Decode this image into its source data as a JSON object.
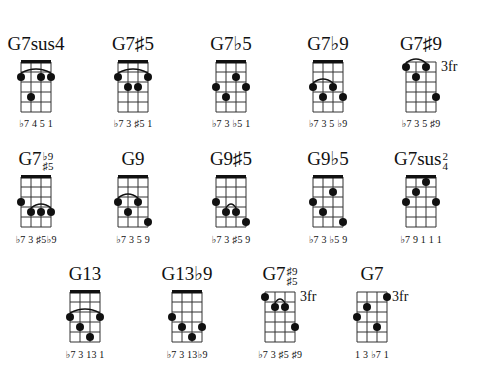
{
  "chords": [
    {
      "name": "G7sus4",
      "base": "G7sus4",
      "cx": 36,
      "row": 0,
      "nut": true,
      "fret_label": "",
      "notes": "♭7 4  5  1",
      "dots": [
        [
          1,
          2
        ],
        [
          3,
          2
        ],
        [
          4,
          2
        ],
        [
          2,
          4
        ]
      ],
      "arc": [
        1,
        4,
        2
      ]
    },
    {
      "name": "G7♯5",
      "base": "G7♯5",
      "cx": 133,
      "row": 0,
      "nut": true,
      "fret_label": "",
      "notes": "♭7 3 ♯5 1",
      "dots": [
        [
          1,
          2
        ],
        [
          4,
          2
        ],
        [
          2,
          3
        ],
        [
          3,
          3
        ]
      ],
      "arc": [
        1,
        4,
        2
      ]
    },
    {
      "name": "G7♭5",
      "base": "G7♭5",
      "cx": 231,
      "row": 0,
      "nut": true,
      "fret_label": "",
      "notes": "♭7 3 ♭5 1",
      "dots": [
        [
          3,
          2
        ],
        [
          1,
          3
        ],
        [
          4,
          3
        ],
        [
          2,
          4
        ]
      ],
      "arc": null
    },
    {
      "name": "G7♭9",
      "base": "G7♭9",
      "cx": 328,
      "row": 0,
      "nut": true,
      "fret_label": "",
      "notes": "♭7 3  5 ♭9",
      "dots": [
        [
          1,
          3
        ],
        [
          3,
          3
        ],
        [
          2,
          4
        ],
        [
          4,
          4
        ]
      ],
      "arc": [
        1,
        3,
        3
      ]
    },
    {
      "name": "G7♯9",
      "base": "G7♯9",
      "cx": 421,
      "row": 0,
      "nut": false,
      "fret_label": "3fr",
      "notes": "♭7 3  5 ♯9",
      "dots": [
        [
          1,
          1
        ],
        [
          3,
          1
        ],
        [
          2,
          2
        ],
        [
          4,
          4
        ]
      ],
      "arc": [
        1,
        3,
        1
      ]
    },
    {
      "name": "G7♭9♯5",
      "base": "G7",
      "stack": [
        "♭9",
        "♯5"
      ],
      "cx": 36,
      "row": 1,
      "nut": true,
      "fret_label": "",
      "notes": "♭7 3 ♯5♭9",
      "dots": [
        [
          1,
          3
        ],
        [
          2,
          4
        ],
        [
          3,
          4
        ],
        [
          4,
          4
        ]
      ],
      "arc": [
        2,
        4,
        4
      ]
    },
    {
      "name": "G9",
      "base": "G9",
      "cx": 133,
      "row": 1,
      "nut": true,
      "fret_label": "",
      "notes": "♭7 3  5  9",
      "dots": [
        [
          1,
          3
        ],
        [
          3,
          3
        ],
        [
          2,
          4
        ],
        [
          4,
          5
        ]
      ],
      "arc": [
        1,
        3,
        3
      ]
    },
    {
      "name": "G9♯5",
      "base": "G9♯5",
      "cx": 231,
      "row": 1,
      "nut": true,
      "fret_label": "",
      "notes": "♭7 3 ♯5 9",
      "dots": [
        [
          1,
          3
        ],
        [
          2,
          4
        ],
        [
          3,
          4
        ],
        [
          4,
          5
        ]
      ],
      "arc": [
        2,
        3,
        4
      ]
    },
    {
      "name": "G9♭5",
      "base": "G9♭5",
      "cx": 328,
      "row": 1,
      "nut": true,
      "fret_label": "",
      "notes": "♭7 3 ♭5 9",
      "dots": [
        [
          3,
          2
        ],
        [
          1,
          3
        ],
        [
          2,
          4
        ],
        [
          4,
          5
        ]
      ],
      "arc": null
    },
    {
      "name": "G7sus2/4",
      "base": "G7sus",
      "stack": [
        "2",
        "4"
      ],
      "cx": 421,
      "row": 1,
      "nut": true,
      "fret_label": "",
      "notes": "♭7 9 1 1 1",
      "dots": [
        [
          3,
          1
        ],
        [
          2,
          2
        ],
        [
          1,
          3
        ],
        [
          4,
          3
        ]
      ],
      "arc": null
    },
    {
      "name": "G13",
      "base": "G13",
      "cx": 85,
      "row": 2,
      "nut": true,
      "fret_label": "",
      "notes": "♭7 3 13 1",
      "dots": [
        [
          1,
          3
        ],
        [
          4,
          3
        ],
        [
          2,
          4
        ],
        [
          3,
          5
        ]
      ],
      "arc": [
        1,
        4,
        3
      ]
    },
    {
      "name": "G13♭9",
      "base": "G13♭9",
      "cx": 187,
      "row": 2,
      "nut": true,
      "fret_label": "",
      "notes": "♭7 3 13♭9",
      "dots": [
        [
          1,
          3
        ],
        [
          2,
          4
        ],
        [
          4,
          4
        ],
        [
          3,
          5
        ]
      ],
      "arc": null
    },
    {
      "name": "G7♯9♯5",
      "base": "G7",
      "stack": [
        "♯9",
        "♯5"
      ],
      "cx": 280,
      "row": 2,
      "nut": false,
      "fret_label": "3fr",
      "notes": "♭7 3 ♯5 ♯9",
      "dots": [
        [
          1,
          1
        ],
        [
          2,
          2
        ],
        [
          3,
          2
        ],
        [
          4,
          4
        ]
      ],
      "arc": [
        2,
        3,
        2
      ]
    },
    {
      "name": "G7",
      "base": "G7",
      "cx": 372,
      "row": 2,
      "nut": false,
      "fret_label": "3fr",
      "notes": "1  3 ♭7 1",
      "dots": [
        [
          4,
          1
        ],
        [
          2,
          2
        ],
        [
          1,
          3
        ],
        [
          3,
          4
        ]
      ],
      "arc": null
    }
  ],
  "layout": {
    "rows": [
      {
        "title_y": 34,
        "grid_y": 62,
        "notes_y": 118
      },
      {
        "title_y": 149,
        "grid_y": 177,
        "notes_y": 234
      },
      {
        "title_y": 264,
        "grid_y": 292,
        "notes_y": 349
      }
    ],
    "string_gap": 10,
    "fret_gap": 10,
    "frets": 5,
    "strings": 4,
    "line_color": "#333333",
    "dot_color": "#111111",
    "nut_color": "#111111"
  }
}
